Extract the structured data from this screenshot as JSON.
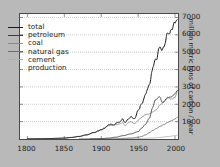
{
  "chart_data": {
    "type": "line",
    "title": "",
    "xlabel": "",
    "ylabel": "million metric tons of carbon / year",
    "xlim": [
      1790,
      2004
    ],
    "ylim": [
      0,
      7200
    ],
    "xticks": [
      "1800",
      "1850",
      "1900",
      "1950",
      "2000"
    ],
    "xtick_values": [
      1800,
      1850,
      1900,
      1950,
      2000
    ],
    "yticks": [
      "1000",
      "2000",
      "3000",
      "4000",
      "5000",
      "6000",
      "7000"
    ],
    "ytick_values": [
      1000,
      2000,
      3000,
      4000,
      5000,
      6000,
      7000
    ],
    "grid": true,
    "grid_style": "dotted",
    "legend_position": "upper left",
    "background_color": "#b9b9b9",
    "plot_background_color": "#ffffff",
    "series": [
      {
        "name": "total",
        "color": "#1a1a1a",
        "x": [
          1800,
          1810,
          1820,
          1830,
          1840,
          1850,
          1860,
          1870,
          1880,
          1890,
          1900,
          1905,
          1910,
          1913,
          1918,
          1920,
          1925,
          1929,
          1932,
          1937,
          1940,
          1945,
          1950,
          1955,
          1960,
          1965,
          1970,
          1973,
          1975,
          1979,
          1982,
          1985,
          1990,
          1992,
          1995,
          2000,
          2003
        ],
        "values": [
          8,
          12,
          17,
          24,
          38,
          54,
          91,
          147,
          236,
          375,
          534,
          635,
          819,
          843,
          806,
          932,
          975,
          1145,
          939,
          1153,
          1299,
          1160,
          1630,
          2043,
          2577,
          3140,
          4076,
          4530,
          4616,
          5356,
          5114,
          5264,
          6143,
          6090,
          6325,
          6700,
          6800
        ]
      },
      {
        "name": "petroleum",
        "color": "#3c3c3c",
        "x": [
          1870,
          1880,
          1890,
          1900,
          1910,
          1920,
          1930,
          1940,
          1950,
          1955,
          1960,
          1965,
          1970,
          1973,
          1979,
          1983,
          1990,
          1995,
          2000,
          2003
        ],
        "values": [
          1,
          4,
          10,
          22,
          52,
          104,
          195,
          294,
          423,
          630,
          849,
          1183,
          1838,
          2239,
          2433,
          2088,
          2360,
          2440,
          2600,
          2780
        ]
      },
      {
        "name": "coal",
        "color": "#8a8a8a",
        "x": [
          1800,
          1820,
          1840,
          1850,
          1860,
          1870,
          1880,
          1890,
          1900,
          1910,
          1913,
          1920,
          1925,
          1929,
          1932,
          1937,
          1940,
          1945,
          1950,
          1955,
          1960,
          1965,
          1970,
          1975,
          1980,
          1985,
          1990,
          1995,
          2000,
          2003
        ],
        "values": [
          8,
          17,
          38,
          54,
          90,
          146,
          232,
          364,
          512,
          765,
          791,
          827,
          860,
          945,
          772,
          935,
          1005,
          880,
          1070,
          1255,
          1410,
          1450,
          1556,
          1700,
          1980,
          2160,
          2400,
          2300,
          2400,
          2750
        ]
      },
      {
        "name": "natural gas",
        "color": "#6e6e6e",
        "x": [
          1885,
          1900,
          1910,
          1920,
          1930,
          1940,
          1950,
          1955,
          1960,
          1965,
          1970,
          1975,
          1980,
          1985,
          1990,
          1995,
          2000,
          2003
        ],
        "values": [
          1,
          4,
          8,
          15,
          39,
          57,
          97,
          150,
          235,
          360,
          495,
          615,
          735,
          830,
          955,
          1050,
          1150,
          1250
        ]
      },
      {
        "name": "cement production",
        "color": "#b0b0b0",
        "x": [
          1928,
          1940,
          1950,
          1960,
          1970,
          1980,
          1990,
          2000,
          2003
        ],
        "values": [
          14,
          17,
          18,
          39,
          60,
          94,
          140,
          190,
          220
        ]
      }
    ]
  },
  "legend": {
    "items": [
      {
        "label": "total",
        "color": "#1a1a1a"
      },
      {
        "label": "petroleum",
        "color": "#3c3c3c"
      },
      {
        "label": "coal",
        "color": "#8a8a8a"
      },
      {
        "label": "natural gas",
        "color": "#6e6e6e"
      },
      {
        "label": "cement",
        "color": "#b0b0b0"
      }
    ],
    "continuation_label": "production"
  },
  "axes": {
    "y_title": "million metric tons of carbon / year",
    "x_tick_labels": [
      "1800",
      "1850",
      "1900",
      "1950",
      "2000"
    ],
    "y_tick_labels": [
      "7000",
      "6000",
      "5000",
      "4000",
      "3000",
      "2000",
      "1000"
    ]
  }
}
